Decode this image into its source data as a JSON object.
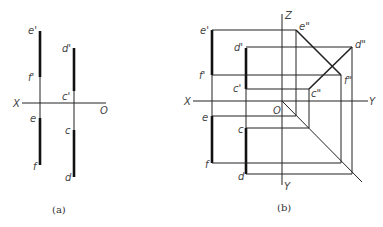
{
  "panel_a": {
    "caption": "(a)",
    "axis_labels": {
      "x": "X",
      "origin": "O"
    },
    "labels": {
      "e_prime": "e'",
      "f_prime": "f'",
      "d_prime": "d'",
      "c_prime": "c'",
      "e": "e",
      "f": "f",
      "c": "c",
      "d": "d"
    }
  },
  "panel_b": {
    "caption": "(b)",
    "axis_labels": {
      "x": "X",
      "y_right": "Y",
      "y_down": "Y",
      "z": "Z",
      "origin": "O"
    },
    "labels": {
      "e_prime": "e'",
      "f_prime": "f'",
      "d_prime": "d'",
      "c_prime": "c'",
      "e": "e",
      "f": "f",
      "c": "c",
      "d": "d",
      "e_dprime": "e\"",
      "d_dprime": "d\"",
      "f_dprime": "f\"",
      "c_dprime": "c\""
    }
  }
}
